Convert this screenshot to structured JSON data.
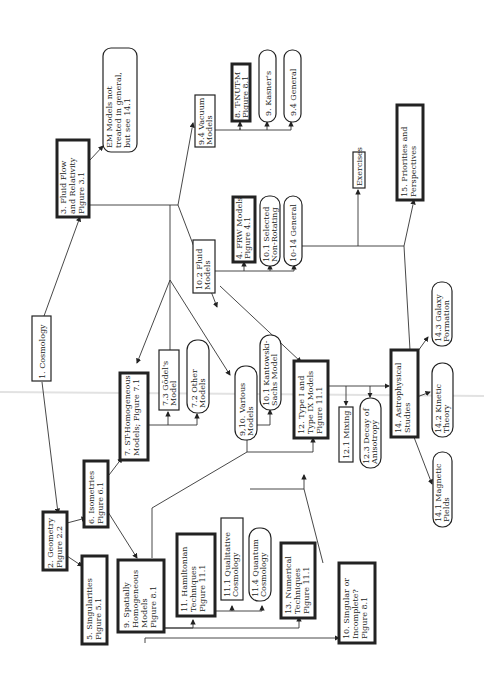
{
  "nodes": {
    "n1": {
      "lines": [
        "1. Cosmology"
      ]
    },
    "n2": {
      "lines": [
        "2. Geometry",
        "Figure 2.2"
      ]
    },
    "n3": {
      "lines": [
        "3. Fluid Flow",
        "and Relativity",
        "Figure 3.1"
      ]
    },
    "n4": {
      "lines": [
        "4. FRW Models",
        "Figure 4.1"
      ]
    },
    "n5": {
      "lines": [
        "5. Singularities",
        "Figure 5.1"
      ]
    },
    "n6": {
      "lines": [
        "6. Isometries",
        "Figure 6.1"
      ]
    },
    "n7": {
      "lines": [
        "7. ST-Homogeneous",
        "Models; Figure 7.1"
      ]
    },
    "n7_2": {
      "lines": [
        "7.2 Other",
        "Models"
      ]
    },
    "n7_3": {
      "lines": [
        "7.3 Gödel's",
        "Model"
      ]
    },
    "n8": {
      "lines": [
        "8. T-NUT-M",
        "Figure 8.1"
      ]
    },
    "n9": {
      "lines": [
        "9. Spatially",
        "Homogeneous",
        "Models",
        "Figure 8.1"
      ]
    },
    "n9_kasner": {
      "lines": [
        "9. Kasner's"
      ]
    },
    "n9_4gen": {
      "lines": [
        "9.4 General"
      ]
    },
    "n9_4vac": {
      "lines": [
        "9.4 Vacuum",
        "Models"
      ]
    },
    "n9_10": {
      "lines": [
        "9,10. Various",
        "Models"
      ]
    },
    "n10": {
      "lines": [
        "10. Singular or",
        "Incomplete?",
        "Figure 8.1"
      ]
    },
    "n10_1sel": {
      "lines": [
        "10.1 Selected",
        "Non-Rotating"
      ]
    },
    "n10_1ks": {
      "lines": [
        "10.1 Kantowski-",
        "Sachs Model"
      ]
    },
    "n10_2": {
      "lines": [
        "10.2 Fluid",
        "Models"
      ]
    },
    "n10_14": {
      "lines": [
        "10-14 General"
      ]
    },
    "n11": {
      "lines": [
        "11. Hamiltonian",
        "Techniques",
        "Figure 11.1"
      ]
    },
    "n11_1": {
      "lines": [
        "11.1 Qualitative",
        "Cosmology"
      ]
    },
    "n11_4": {
      "lines": [
        "11.4 Quantum",
        "Cosmology"
      ]
    },
    "n12": {
      "lines": [
        "12. Type I and",
        "Type IX Models",
        "Figure 11.1"
      ]
    },
    "n12_1": {
      "lines": [
        "12.1 Mixing"
      ]
    },
    "n12_3": {
      "lines": [
        "12.3 Decay of",
        "Anisotropy"
      ]
    },
    "n13": {
      "lines": [
        "13. Numerical",
        "Techniques",
        "Figure 11.1"
      ]
    },
    "n14": {
      "lines": [
        "14. Astrophysical",
        "Studies"
      ]
    },
    "n14_1": {
      "lines": [
        "14.1 Magnetic",
        "Fields"
      ]
    },
    "n14_2": {
      "lines": [
        "14.2 Kinetic",
        "Theory"
      ]
    },
    "n14_3": {
      "lines": [
        "14.3 Galaxy",
        "Formation"
      ]
    },
    "n15": {
      "lines": [
        "15. Priorities and",
        "Perspectives"
      ]
    },
    "em": {
      "lines": [
        "EM Models not",
        "treated in general,",
        "but see 14.1"
      ]
    },
    "ex": {
      "lines": [
        "Exercises"
      ]
    }
  }
}
